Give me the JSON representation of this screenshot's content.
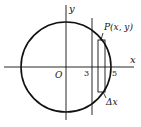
{
  "diagram": {
    "axes": {
      "x_label": "x",
      "y_label": "y",
      "origin_label": "O"
    },
    "ticks": {
      "three": "3",
      "five": "5"
    },
    "point_label": "P(x, y)",
    "strip_label": "Δx",
    "colors": {
      "stroke": "#111111",
      "background": "#ffffff"
    }
  }
}
